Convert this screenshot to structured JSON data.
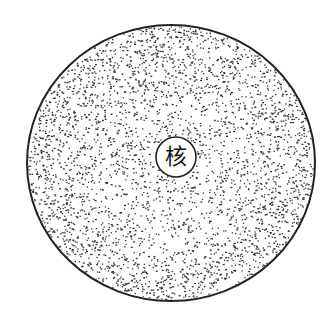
{
  "diagram": {
    "outer": {
      "cx": 171,
      "cy": 163,
      "rx": 144,
      "ry": 138,
      "fill": "stippled",
      "stroke": "#222222"
    },
    "nucleus": {
      "cx": 176,
      "cy": 157,
      "r": 20,
      "label": "核",
      "stroke": "#222222"
    }
  },
  "colors": {
    "ink": "#222222",
    "background": "#ffffff"
  }
}
